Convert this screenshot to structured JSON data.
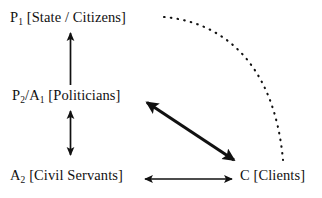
{
  "diagram": {
    "background_color": "#ffffff",
    "stroke_color": "#111111",
    "width": 322,
    "height": 198,
    "nodes": [
      {
        "id": "state",
        "prefix": "P",
        "subscript": "1",
        "bracket_text": " [State / Citizens]",
        "full_text": "P1 [State / Citizens]"
      },
      {
        "id": "politicians",
        "prefix": "P",
        "subscript": "2",
        "mid": "/A",
        "subscript2": "1",
        "bracket_text": " [Politicians]",
        "full_text": "P2/A1 [Politicians]"
      },
      {
        "id": "servants",
        "prefix": "A",
        "subscript": "2",
        "bracket_text": " [Civil Servants]",
        "full_text": "A2 [Civil Servants]"
      },
      {
        "id": "clients",
        "prefix": "C",
        "subscript": "",
        "bracket_text": " [Clients]",
        "full_text": "C [Clients]"
      }
    ],
    "edges": [
      {
        "id": "politicians-to-state",
        "from": "politicians",
        "to": "state",
        "style": "solid",
        "heads": "single",
        "direction": "up"
      },
      {
        "id": "politicians-servants",
        "from": "politicians",
        "to": "servants",
        "style": "solid",
        "heads": "double",
        "direction": "vertical"
      },
      {
        "id": "politicians-clients",
        "from": "politicians",
        "to": "clients",
        "style": "solid-thick",
        "heads": "double",
        "direction": "diagonal"
      },
      {
        "id": "servants-clients",
        "from": "servants",
        "to": "clients",
        "style": "solid",
        "heads": "double",
        "direction": "horizontal"
      },
      {
        "id": "state-clients-dotted",
        "from": "state",
        "to": "clients",
        "style": "dotted-arc",
        "heads": "none",
        "direction": "arc"
      }
    ]
  }
}
